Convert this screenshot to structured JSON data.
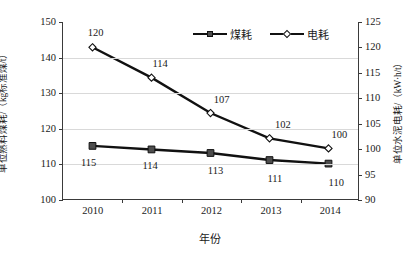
{
  "chart_data": {
    "type": "line",
    "title": "",
    "xlabel": "年份",
    "ylabel": "单位熟料煤耗/（kg标准煤/t）",
    "ylabel_right": "单位水泥电耗/（kW·h/t）",
    "categories": [
      "2010",
      "2011",
      "2012",
      "2013",
      "2014"
    ],
    "series": [
      {
        "name": "煤耗",
        "axis": "left",
        "marker": "filled-square",
        "values": [
          115,
          114,
          113,
          111,
          110
        ],
        "data_labels": [
          "115",
          "114",
          "113",
          "111",
          "110"
        ]
      },
      {
        "name": "电耗",
        "axis": "right",
        "marker": "open-diamond",
        "values": [
          120,
          114,
          107,
          102,
          100
        ],
        "data_labels": [
          "120",
          "114",
          "107",
          "102",
          "100"
        ]
      }
    ],
    "ylim": [
      100,
      150
    ],
    "yticks": [
      "100",
      "110",
      "120",
      "130",
      "140",
      "150"
    ],
    "ylim_right": [
      90,
      125
    ],
    "yticks_right": [
      "90",
      "95",
      "100",
      "105",
      "110",
      "115",
      "120",
      "125"
    ],
    "grid": true,
    "legend_position": "top-center",
    "colors": {
      "line": "#111111",
      "coal_marker_fill": "#4d4d4d",
      "power_marker_fill": "#ffffff",
      "grid": "#d9d9d9",
      "axis": "#3a3a3a",
      "text": "#1a1a1a"
    }
  },
  "legend": {
    "items": [
      {
        "label": "煤耗",
        "marker": "filled-square"
      },
      {
        "label": "电耗",
        "marker": "open-diamond"
      }
    ]
  }
}
